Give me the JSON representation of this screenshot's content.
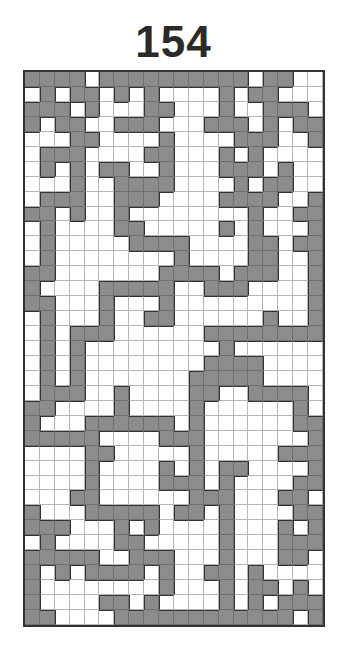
{
  "puzzle": {
    "number": "154",
    "columns": 20,
    "rows": 37,
    "colors": {
      "filled": "#8c8c8c",
      "empty": "#ffffff",
      "border": "#333333",
      "gridline": "#b5b5b5"
    },
    "grid": [
      "GGGGWGGGGGGGGGGWGGWW",
      "WGWGGWGWGWWWWGWGGWWW",
      "GGGWGWWWGGWWWGWWGGGW",
      "GWGGWWGGGWWWGGGWGWGG",
      "WWWGGWWWWGWWWWGGGWWG",
      "WGGGWWWWGGWWWGWGWWWW",
      "WGWGWGGWWGWWWGGGWGWW",
      "WWWGWWGGGGWWWWGWGGWW",
      "WGGGWWGGGWWWWGGGGWWG",
      "GGWGWWGWWWWWWWWGWWGG",
      "WGWWWWGGWWWWWGWGWWWG",
      "WGWWWWWGGGGWWWWGGWGG",
      "WGWWWWWWWWGWWWWGGWWG",
      "GGWWWWWWWGGGGWGGGWWG",
      "GWWWWGGGGGWWGGGWWWWG",
      "GGWWWGWWWGWWWWWWWWWG",
      "WGWWWGWWGGWWWWWWGWWG",
      "WGWGGGWWWWWWGGGGGGGG",
      "WGWGWWWWWWWWWGWWWWWW",
      "WGWGWWWWWWWWGGGGWWWW",
      "WGWGWWWWWWWGGGGGWWWW",
      "WGGGWWGWWWWGGWWGGGGW",
      "GGWWWWGWWWWGWWWWWWGW",
      "GWWWGGGGGGWGWWWWWWGG",
      "GGGGGWWWWGGGWWWWWWWG",
      "WWWWGGWWWWWGWWWWWGGG",
      "WWWWGWWWWGWGWGGWWWWG",
      "WWWWGWWWWGGGWGWWWWGG",
      "WWWGGWWWWWWGGGWWWGGW",
      "GWWWGGGGGWGGWGWWWWGG",
      "GGGWWWGWGWWWWGWWWGWG",
      "WGWWWWGGWWWWWGWWWGGG",
      "GGGGGWWGGGWWWGWWWGGW",
      "GWGWGGGGWGWWGGWGWWWW",
      "GWWWWWWWWGWWWGWGGWGW",
      "GWWWWGGWGWWWWGWGWGGG",
      "GGWWWWGGGGGGGGGGGGWG"
    ]
  }
}
